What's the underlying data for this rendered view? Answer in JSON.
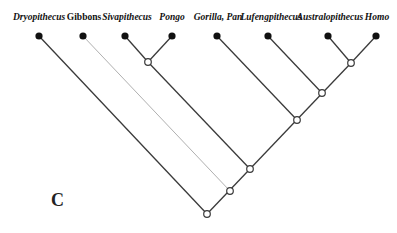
{
  "panel_label": "C",
  "taxa": [
    {
      "name": "Dryopithecus",
      "italic": true,
      "x": 39,
      "y": 36
    },
    {
      "name": "Gibbons",
      "italic": false,
      "x": 83,
      "y": 36
    },
    {
      "name": "Sivapithecus",
      "italic": true,
      "x": 125,
      "y": 36
    },
    {
      "name": "Pongo",
      "italic": true,
      "x": 172,
      "y": 36
    },
    {
      "name": "Gorilla, Pan",
      "italic": true,
      "x": 217,
      "y": 36
    },
    {
      "name": "Lufengpithecus",
      "italic": true,
      "x": 268,
      "y": 36
    },
    {
      "name": "Australopithecus",
      "italic": true,
      "x": 328,
      "y": 36
    },
    {
      "name": "Homo",
      "italic": true,
      "x": 376,
      "y": 36
    }
  ],
  "internal_nodes": [
    {
      "id": "siva_pongo",
      "x": 148,
      "y": 62
    },
    {
      "id": "austr_homo",
      "x": 351,
      "y": 63
    },
    {
      "id": "lufeng_clade",
      "x": 322,
      "y": 93
    },
    {
      "id": "gorilla_clade",
      "x": 297,
      "y": 120
    },
    {
      "id": "pongine_clade",
      "x": 250,
      "y": 169
    },
    {
      "id": "gibbon_clade",
      "x": 230,
      "y": 191
    },
    {
      "id": "root",
      "x": 207,
      "y": 214
    }
  ],
  "colors": {
    "branch": "#3a3a3a",
    "gibbon_branch": "#b0b0b0",
    "leaf": "#111111"
  }
}
